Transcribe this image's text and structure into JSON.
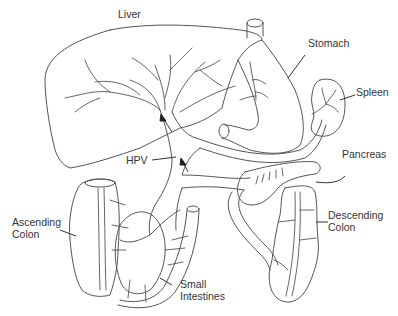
{
  "diagram": {
    "labels": {
      "liver": "Liver",
      "stomach": "Stomach",
      "spleen": "Spleen",
      "pancreas": "Pancreas",
      "hpv": "HPV",
      "ascending_colon_line1": "Ascending",
      "ascending_colon_line2": "Colon",
      "descending_colon_line1": "Descending",
      "descending_colon_line2": "Colon",
      "small_intestines_line1": "Small",
      "small_intestines_line2": "Intestines"
    },
    "colors": {
      "stroke": "#555555",
      "text": "#333333",
      "background": "#ffffff"
    }
  }
}
